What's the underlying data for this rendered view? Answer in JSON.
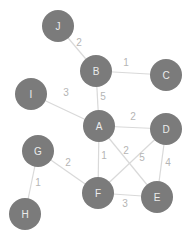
{
  "graph": {
    "type": "weighted-undirected-graph",
    "colors": {
      "background": "#ffffff",
      "node_fill": "#7b7b7b",
      "node_text": "#ececec",
      "edge": "#d9d9d9",
      "edge_label": "#b5b5b5"
    },
    "node_radius": 16,
    "nodes": [
      {
        "id": "A",
        "label": "A",
        "x": 99,
        "y": 126
      },
      {
        "id": "B",
        "label": "B",
        "x": 96,
        "y": 71
      },
      {
        "id": "C",
        "label": "C",
        "x": 166,
        "y": 75
      },
      {
        "id": "D",
        "label": "D",
        "x": 166,
        "y": 129
      },
      {
        "id": "E",
        "label": "E",
        "x": 157,
        "y": 197
      },
      {
        "id": "F",
        "label": "F",
        "x": 98,
        "y": 193
      },
      {
        "id": "G",
        "label": "G",
        "x": 38,
        "y": 151
      },
      {
        "id": "H",
        "label": "H",
        "x": 25,
        "y": 214
      },
      {
        "id": "I",
        "label": "I",
        "x": 31,
        "y": 94
      },
      {
        "id": "J",
        "label": "J",
        "x": 58,
        "y": 26
      }
    ],
    "edges": [
      {
        "from": "J",
        "to": "B",
        "weight": "2",
        "lx": 79,
        "ly": 42
      },
      {
        "from": "B",
        "to": "C",
        "weight": "1",
        "lx": 126,
        "ly": 62
      },
      {
        "from": "B",
        "to": "A",
        "weight": "5",
        "lx": 103,
        "ly": 96
      },
      {
        "from": "I",
        "to": "A",
        "weight": "3",
        "lx": 66,
        "ly": 92
      },
      {
        "from": "A",
        "to": "D",
        "weight": "2",
        "lx": 133,
        "ly": 116
      },
      {
        "from": "A",
        "to": "E",
        "weight": "2",
        "lx": 126,
        "ly": 150
      },
      {
        "from": "A",
        "to": "F",
        "weight": "1",
        "lx": 104,
        "ly": 155
      },
      {
        "from": "D",
        "to": "F",
        "weight": "5",
        "lx": 142,
        "ly": 157
      },
      {
        "from": "D",
        "to": "E",
        "weight": "4",
        "lx": 168,
        "ly": 162
      },
      {
        "from": "G",
        "to": "F",
        "weight": "2",
        "lx": 68,
        "ly": 162
      },
      {
        "from": "G",
        "to": "H",
        "weight": "1",
        "lx": 38,
        "ly": 182
      },
      {
        "from": "F",
        "to": "E",
        "weight": "3",
        "lx": 125,
        "ly": 203
      }
    ]
  }
}
